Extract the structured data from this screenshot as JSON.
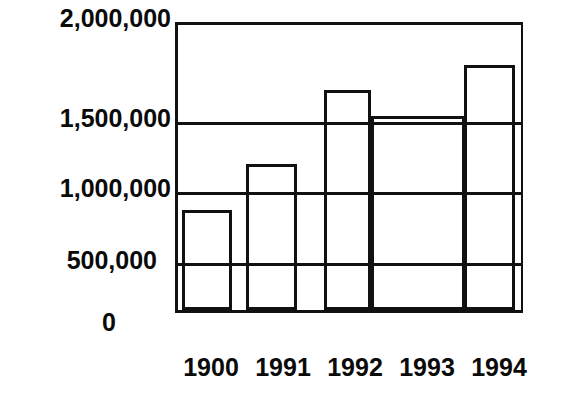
{
  "chart_data": {
    "type": "bar",
    "title": "",
    "subtitle": "",
    "xlabel": "",
    "ylabel": "",
    "categories": [
      "1900",
      "1991",
      "1992",
      "1993",
      "1994"
    ],
    "values": [
      835000,
      1160000,
      1650000,
      1500000,
      1810000
    ],
    "series": [
      {
        "name": "",
        "values": [
          835000,
          1160000,
          1650000,
          1500000,
          1810000
        ]
      }
    ],
    "ylim": [
      0,
      2000000
    ],
    "xlim": [
      0,
      5
    ],
    "ytick_labels": [
      "2,000,000",
      "1,500,000",
      "1,000,000",
      "500,000",
      "0"
    ],
    "ytick_values": [
      2000000,
      1500000,
      1000000,
      500000,
      0
    ],
    "xtick_labels": [
      "1900",
      "1991",
      "1992",
      "1993",
      "1994"
    ],
    "grid": true,
    "grid_axis": "y",
    "legend": false,
    "legend_position": "none",
    "annotations": [],
    "colors": {
      "bar_fill": "#ffffff",
      "bar_edge": "#111111",
      "grid": "#111111",
      "axis": "#111111",
      "text": "#0a0a0a",
      "background": "#ffffff"
    }
  },
  "yaxis": {
    "ticks": [
      {
        "label": "2,000,000",
        "value": 2000000,
        "top": 6
      },
      {
        "label": "1,500,000",
        "value": 1500000,
        "top": 106
      },
      {
        "label": "1,000,000",
        "value": 1000000,
        "top": 176
      },
      {
        "label": "500,000",
        "value": 500000,
        "top": 248
      },
      {
        "label": "0",
        "value": 0,
        "top": 310
      }
    ]
  },
  "xaxis": {
    "ticks": [
      {
        "label": "1900",
        "left": 0,
        "width": 72
      },
      {
        "label": "1991",
        "left": 72,
        "width": 72
      },
      {
        "label": "1992",
        "left": 144,
        "width": 72
      },
      {
        "label": "1993",
        "left": 216,
        "width": 72
      },
      {
        "label": "1994",
        "left": 288,
        "width": 72
      }
    ]
  },
  "gridlines": [
    {
      "label": "1,500,000",
      "value": 1500000,
      "top": 97
    },
    {
      "label": "1,000,000",
      "value": 1000000,
      "top": 167
    },
    {
      "label": "500,000",
      "value": 500000,
      "top": 238
    }
  ],
  "bars": [
    {
      "category": "1900",
      "value": 835000,
      "left": 4,
      "width": 50,
      "height": 100
    },
    {
      "category": "1991",
      "value": 1160000,
      "left": 68,
      "width": 51,
      "height": 146
    },
    {
      "category": "1992",
      "value": 1650000,
      "left": 146,
      "width": 47,
      "height": 220
    },
    {
      "category": "1993",
      "value": 1500000,
      "left": 193,
      "width": 94,
      "height": 194
    },
    {
      "category": "1994",
      "value": 1810000,
      "left": 286,
      "width": 51,
      "height": 245
    }
  ]
}
